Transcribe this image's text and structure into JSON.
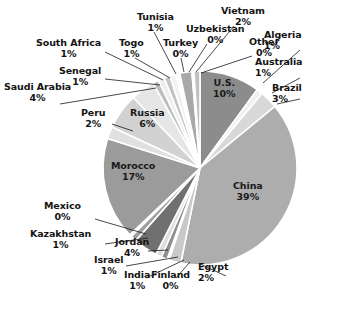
{
  "chart_data": {
    "type": "pie",
    "title": "",
    "subtitle": "",
    "legend_position": "callout-labels",
    "grid": false,
    "value_unit": "percent",
    "total": 100,
    "categories": [
      "U.S.",
      "Australia",
      "Brazil",
      "China",
      "Egypt",
      "Finland",
      "India",
      "Israel",
      "Jordan",
      "Kazakhstan",
      "Mexico",
      "Morocco",
      "Peru",
      "Russia",
      "Saudi Arabia",
      "Senegal",
      "South Africa",
      "Togo",
      "Tunisia",
      "Turkey",
      "Uzbekistan",
      "Vietnam",
      "Other",
      "Algeria"
    ],
    "values": [
      10,
      1,
      3,
      39,
      2,
      0,
      1,
      1,
      4,
      1,
      0,
      17,
      2,
      6,
      4,
      1,
      1,
      1,
      1,
      0,
      0,
      2,
      0,
      1
    ],
    "slices": [
      {
        "label": "U.S.",
        "pct_text": "10%",
        "value": 10,
        "sweep": 36.0,
        "color": "#8c8c8c",
        "label_mode": "inside",
        "lx": 224,
        "ly": 88,
        "align": "center"
      },
      {
        "label": "Australia",
        "pct_text": "1%",
        "value": 1,
        "sweep": 3.6,
        "color": "#f0f0f0",
        "label_mode": "callout",
        "lx": 302,
        "ly": 67,
        "align": "left",
        "leader": [
          [
            300,
            78
          ],
          [
            272,
            93
          ]
        ]
      },
      {
        "label": "Brazil",
        "pct_text": "3%",
        "value": 3,
        "sweep": 10.8,
        "color": "#d8d8d8",
        "label_mode": "callout",
        "lx": 302,
        "ly": 93,
        "align": "left",
        "leader": [
          [
            300,
            99
          ],
          [
            277,
            104
          ]
        ]
      },
      {
        "label": "China",
        "pct_text": "39%",
        "value": 39,
        "sweep": 140.4,
        "color": "#adadad",
        "label_mode": "inside",
        "lx": 248,
        "ly": 191,
        "align": "center"
      },
      {
        "label": "Egypt",
        "pct_text": "2%",
        "value": 2,
        "sweep": 7.2,
        "color": "#c9c9c9",
        "label_mode": "callout",
        "lx": 228,
        "ly": 272,
        "align": "left",
        "leader": [
          [
            226,
            276
          ],
          [
            200,
            264
          ]
        ]
      },
      {
        "label": "Finland",
        "pct_text": "0%",
        "value": 0,
        "sweep": 1.2,
        "color": "#ededed",
        "label_mode": "callout",
        "lx": 170,
        "ly": 280,
        "align": "center",
        "leader": [
          [
            176,
            278
          ],
          [
            190,
            262
          ]
        ]
      },
      {
        "label": "India",
        "pct_text": "1%",
        "value": 1,
        "sweep": 3.6,
        "color": "#8f8f8f",
        "label_mode": "callout",
        "lx": 137,
        "ly": 280,
        "align": "center",
        "leader": [
          [
            146,
            278
          ],
          [
            184,
            260
          ]
        ]
      },
      {
        "label": "Israel",
        "pct_text": "1%",
        "value": 1,
        "sweep": 3.6,
        "color": "#dddddd",
        "label_mode": "callout",
        "lx": 108,
        "ly": 265,
        "align": "center",
        "leader": [
          [
            126,
            266
          ],
          [
            178,
            257
          ]
        ]
      },
      {
        "label": "Jordan",
        "pct_text": "4%",
        "value": 4,
        "sweep": 14.4,
        "color": "#707070",
        "label_mode": "callout",
        "lx": 132,
        "ly": 247,
        "align": "center",
        "leader": [
          [
            148,
            251
          ],
          [
            168,
            250
          ]
        ]
      },
      {
        "label": "Kazakhstan",
        "pct_text": "1%",
        "value": 1,
        "sweep": 3.6,
        "color": "#9e9e9e",
        "label_mode": "callout",
        "lx": 60,
        "ly": 239,
        "align": "center",
        "leader": [
          [
            105,
            244
          ],
          [
            148,
            238
          ]
        ]
      },
      {
        "label": "Mexico",
        "pct_text": "0%",
        "value": 0,
        "sweep": 1.2,
        "color": "#e3e3e3",
        "label_mode": "callout",
        "lx": 62,
        "ly": 211,
        "align": "center",
        "leader": [
          [
            95,
            219
          ],
          [
            146,
            234
          ]
        ]
      },
      {
        "label": "Morocco",
        "pct_text": "17%",
        "value": 17,
        "sweep": 61.2,
        "color": "#9b9b9b",
        "label_mode": "inside",
        "lx": 133,
        "ly": 171,
        "align": "center"
      },
      {
        "label": "Peru",
        "pct_text": "2%",
        "value": 2,
        "sweep": 7.2,
        "color": "#e0e0e0",
        "label_mode": "callout",
        "lx": 93,
        "ly": 118,
        "align": "center",
        "leader": [
          [
            112,
            124
          ],
          [
            133,
            131
          ]
        ]
      },
      {
        "label": "Russia",
        "pct_text": "6%",
        "value": 6,
        "sweep": 21.6,
        "color": "#d2d2d2",
        "label_mode": "inside",
        "lx": 147,
        "ly": 118,
        "align": "center"
      },
      {
        "label": "Saudi Arabia",
        "pct_text": "4%",
        "value": 4,
        "sweep": 14.4,
        "color": "#e6e6e6",
        "label_mode": "callout",
        "lx": 37,
        "ly": 92,
        "align": "center",
        "leader": [
          [
            60,
            104
          ],
          [
            156,
            88
          ]
        ]
      },
      {
        "label": "Senegal",
        "pct_text": "1%",
        "value": 1,
        "sweep": 3.6,
        "color": "#bdbdbd",
        "label_mode": "callout",
        "lx": 80,
        "ly": 76,
        "align": "center",
        "leader": [
          [
            105,
            79
          ],
          [
            160,
            85
          ]
        ]
      },
      {
        "label": "South Africa",
        "pct_text": "1%",
        "value": 1,
        "sweep": 3.6,
        "color": "#ededed",
        "label_mode": "callout",
        "lx": 68,
        "ly": 48,
        "align": "center",
        "leader": [
          [
            105,
            52
          ],
          [
            163,
            80
          ]
        ]
      },
      {
        "label": "Togo",
        "pct_text": "1%",
        "value": 1,
        "sweep": 3.6,
        "color": "#c4c4c4",
        "label_mode": "callout",
        "lx": 131,
        "ly": 48,
        "align": "center",
        "leader": [
          [
            135,
            58
          ],
          [
            170,
            78
          ]
        ]
      },
      {
        "label": "Tunisia",
        "pct_text": "1%",
        "value": 1,
        "sweep": 3.6,
        "color": "#f2f2f2",
        "label_mode": "callout",
        "lx": 155,
        "ly": 22,
        "align": "center",
        "leader": [
          [
            154,
            32
          ],
          [
            176,
            74
          ]
        ]
      },
      {
        "label": "Turkey",
        "pct_text": "0%",
        "value": 0,
        "sweep": 1.2,
        "color": "#cfcfcf",
        "label_mode": "callout",
        "lx": 180,
        "ly": 48,
        "align": "center",
        "leader": [
          [
            181,
            58
          ],
          [
            184,
            72
          ]
        ]
      },
      {
        "label": "Uzbekistan",
        "pct_text": "0%",
        "value": 0,
        "sweep": 1.2,
        "color": "#f5f5f5",
        "label_mode": "callout",
        "lx": 215,
        "ly": 34,
        "align": "center",
        "leader": [
          [
            207,
            44
          ],
          [
            189,
            72
          ]
        ]
      },
      {
        "label": "Vietnam",
        "pct_text": "2%",
        "value": 2,
        "sweep": 7.2,
        "color": "#a8a8a8",
        "label_mode": "callout",
        "lx": 243,
        "ly": 16,
        "align": "center",
        "leader": [
          [
            234,
            26
          ],
          [
            196,
            72
          ]
        ]
      },
      {
        "label": "Other",
        "pct_text": "0%",
        "value": 0,
        "sweep": 1.2,
        "color": "#e9e9e9",
        "label_mode": "callout",
        "lx": 264,
        "ly": 47,
        "align": "center",
        "leader": [
          [
            252,
            56
          ],
          [
            201,
            73
          ]
        ]
      },
      {
        "label": "Algeria",
        "pct_text": "1%",
        "value": 1,
        "sweep": 3.6,
        "color": "#c0c0c0",
        "label_mode": "callout",
        "lx": 302,
        "ly": 40,
        "align": "left",
        "leader": [
          [
            300,
            50
          ],
          [
            263,
            83
          ]
        ]
      }
    ],
    "geometry": {
      "cx": 200,
      "cy": 168,
      "r": 97,
      "start_angle_deg": -90,
      "direction": "clockwise",
      "slice_stroke": "#ffffff",
      "slice_stroke_width": 1.6,
      "background": "#ffffff"
    }
  }
}
